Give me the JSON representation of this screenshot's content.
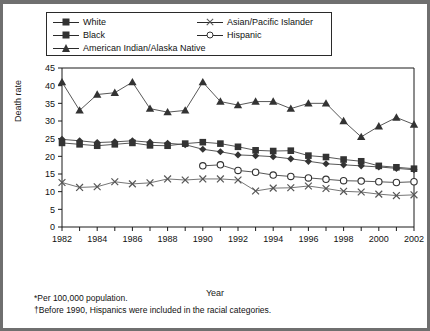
{
  "figure": {
    "y_axis_title": "Death rate",
    "x_axis_title": "Year",
    "footnote_1": "*Per 100,000 population.",
    "footnote_2": "†Before 1990, Hispanics were included in the racial categories."
  },
  "legend": {
    "items": [
      {
        "label": "White",
        "marker": "diamond-marker-icon",
        "color": "#333333"
      },
      {
        "label": "Black",
        "marker": "square-marker-icon",
        "color": "#333333"
      },
      {
        "label": "American Indian/Alaska Native",
        "marker": "triangle-marker-icon",
        "color": "#333333"
      },
      {
        "label": "Asian/Pacific Islander",
        "marker": "x-marker-icon",
        "color": "#555555"
      },
      {
        "label": "Hispanic",
        "marker": "circle-marker-icon",
        "color": "#333333"
      }
    ]
  },
  "chart_data": {
    "type": "line",
    "title": "",
    "xlabel": "Year",
    "ylabel": "Death rate",
    "xlim": [
      1982,
      2002
    ],
    "ylim": [
      0,
      45
    ],
    "ytick_step": 5,
    "yticks": [
      0,
      5,
      10,
      15,
      20,
      25,
      30,
      35,
      40,
      45
    ],
    "xticks": [
      1982,
      1983,
      1984,
      1985,
      1986,
      1987,
      1988,
      1989,
      1990,
      1991,
      1992,
      1993,
      1994,
      1995,
      1996,
      1997,
      1998,
      1999,
      2000,
      2001,
      2002
    ],
    "xtick_labels": [
      1982,
      1984,
      1986,
      1988,
      1990,
      1992,
      1994,
      1996,
      1998,
      2000,
      2002
    ],
    "grid": false,
    "legend_position": "top",
    "x": [
      1982,
      1983,
      1984,
      1985,
      1986,
      1987,
      1988,
      1989,
      1990,
      1991,
      1992,
      1993,
      1994,
      1995,
      1996,
      1997,
      1998,
      1999,
      2000,
      2001,
      2002
    ],
    "series": [
      {
        "name": "White",
        "marker": "diamond",
        "values": [
          24.8,
          24.4,
          23.9,
          24.1,
          24.4,
          24.0,
          23.7,
          23.3,
          22.0,
          21.3,
          20.4,
          20.2,
          19.9,
          19.3,
          18.6,
          17.9,
          17.6,
          17.3,
          17.0,
          16.6,
          16.2
        ]
      },
      {
        "name": "Black",
        "marker": "square",
        "values": [
          23.8,
          23.4,
          23.0,
          23.4,
          23.8,
          23.1,
          23.0,
          23.6,
          24.0,
          23.6,
          22.7,
          21.7,
          21.5,
          21.6,
          20.2,
          19.8,
          19.1,
          18.6,
          17.3,
          16.9,
          16.5
        ]
      },
      {
        "name": "American Indian/Alaska Native",
        "marker": "triangle",
        "values": [
          41.0,
          33.0,
          37.5,
          38.0,
          41.0,
          33.5,
          32.5,
          33.0,
          41.0,
          35.5,
          34.5,
          35.5,
          35.5,
          33.5,
          35.0,
          35.0,
          30.0,
          25.5,
          28.5,
          31.0,
          29.0
        ]
      },
      {
        "name": "Asian/Pacific Islander",
        "marker": "x",
        "values": [
          12.6,
          11.2,
          11.4,
          12.8,
          12.2,
          12.5,
          13.6,
          13.3,
          13.6,
          13.6,
          13.3,
          10.2,
          11.0,
          11.1,
          11.6,
          10.9,
          10.1,
          9.9,
          9.3,
          8.9,
          9.1
        ]
      },
      {
        "name": "Hispanic",
        "marker": "circle",
        "values": [
          null,
          null,
          null,
          null,
          null,
          null,
          null,
          null,
          17.3,
          17.6,
          16.0,
          15.5,
          14.7,
          14.3,
          13.9,
          13.5,
          13.1,
          13.0,
          12.8,
          12.6,
          12.8
        ]
      }
    ]
  }
}
